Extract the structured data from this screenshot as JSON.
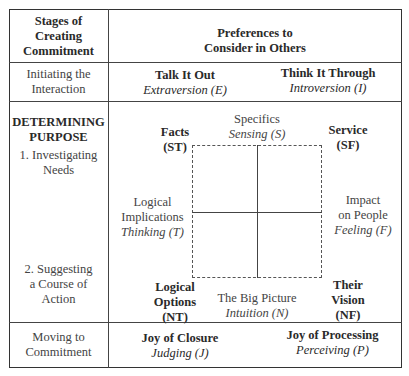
{
  "header": {
    "left": "Stages of Creating Commitment",
    "left_lines": [
      "Stages of",
      "Creating",
      "Commitment"
    ],
    "right_lines": [
      "Preferences to",
      "Consider in Others"
    ]
  },
  "row_initiating": {
    "stage_lines": [
      "Initiating the",
      "Interaction"
    ],
    "left": {
      "title": "Talk It Out",
      "type": "Extraversion (E)"
    },
    "right": {
      "title": "Think It Through",
      "type": "Introversion (I)"
    }
  },
  "row_determining": {
    "stage_title_lines": [
      "DETERMINING",
      "PURPOSE"
    ],
    "step1_lines": [
      "1. Investigating",
      "Needs"
    ],
    "step2_lines": [
      "2. Suggesting",
      "a Course of",
      "Action"
    ],
    "top": {
      "title": "Specifics",
      "type": "Sensing (S)"
    },
    "bottom": {
      "title": "The Big Picture",
      "type": "Intuition (N)"
    },
    "left": {
      "lines": [
        "Logical",
        "Implications"
      ],
      "type": "Thinking (T)"
    },
    "right": {
      "lines": [
        "Impact",
        "on People"
      ],
      "type": "Feeling (F)"
    },
    "corner_tl": {
      "lines": [
        "Facts",
        "(ST)"
      ]
    },
    "corner_tr": {
      "lines": [
        "Service",
        "(SF)"
      ]
    },
    "corner_bl": {
      "lines": [
        "Logical",
        "Options",
        "(NT)"
      ]
    },
    "corner_br": {
      "lines": [
        "Their",
        "Vision",
        "(NF)"
      ]
    }
  },
  "row_moving": {
    "stage_lines": [
      "Moving to",
      "Commitment"
    ],
    "left": {
      "title": "Joy of Closure",
      "type": "Judging (J)"
    },
    "right": {
      "title": "Joy of Processing",
      "type": "Perceiving (P)"
    }
  }
}
